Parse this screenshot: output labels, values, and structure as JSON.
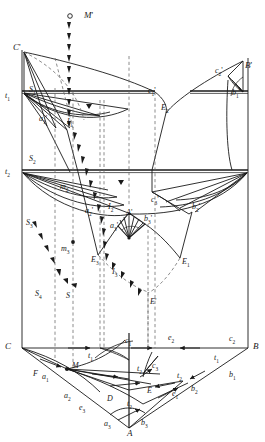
{
  "figure": {
    "type": "descriptive-geometry-projection-diagram",
    "title": "",
    "stroke_color": "#1a1a1a",
    "dashed_color": "#555555",
    "background": "#ffffff"
  },
  "labels": [
    {
      "id": "M-prime",
      "text": "M",
      "prime": "'",
      "x": 84,
      "y": 11,
      "size": "big"
    },
    {
      "id": "C-prime",
      "text": "C",
      "prime": "'",
      "x": 13,
      "y": 43,
      "size": "big"
    },
    {
      "id": "B-prime",
      "text": "B",
      "prime": "'",
      "x": 245,
      "y": 61,
      "size": "big"
    },
    {
      "id": "t1-upper",
      "text": "t",
      "sub": "1",
      "x": 5,
      "y": 92
    },
    {
      "id": "S1",
      "text": "S",
      "sub": "1",
      "x": 29,
      "y": 86
    },
    {
      "id": "c1-prime",
      "text": "c",
      "sub": "1",
      "prime": "'",
      "x": 148,
      "y": 87
    },
    {
      "id": "c2-prime-upper",
      "text": "c",
      "sub": "2",
      "prime": "'",
      "x": 215,
      "y": 67
    },
    {
      "id": "b1-prime",
      "text": "b",
      "sub": "1",
      "prime": "'",
      "x": 232,
      "y": 89
    },
    {
      "id": "a1-prime",
      "text": "a",
      "sub": "1",
      "prime": "'",
      "x": 39,
      "y": 115
    },
    {
      "id": "I1",
      "text": "I",
      "sub": "1",
      "x": 67,
      "y": 118
    },
    {
      "id": "E2",
      "text": "E",
      "sub": "2",
      "x": 161,
      "y": 104
    },
    {
      "id": "t2-left",
      "text": "t",
      "sub": "2",
      "x": 5,
      "y": 168
    },
    {
      "id": "S2",
      "text": "S",
      "sub": "2",
      "x": 29,
      "y": 155
    },
    {
      "id": "m2",
      "text": "m",
      "sub": "2",
      "x": 60,
      "y": 183
    },
    {
      "id": "c3-prime",
      "text": "c",
      "sub": "3",
      "prime": "'",
      "x": 151,
      "y": 196
    },
    {
      "id": "b2-prime",
      "text": "b",
      "sub": "2",
      "prime": "'",
      "x": 192,
      "y": 203
    },
    {
      "id": "a2-prime",
      "text": "a",
      "sub": "2",
      "prime": "'",
      "x": 85,
      "y": 207
    },
    {
      "id": "I2",
      "text": "I",
      "sub": "2",
      "x": 108,
      "y": 203
    },
    {
      "id": "A-prime",
      "text": "A",
      "prime": "'",
      "x": 126,
      "y": 209
    },
    {
      "id": "b3-prime",
      "text": "b",
      "sub": "3",
      "prime": "'",
      "x": 144,
      "y": 215
    },
    {
      "id": "a3-prime",
      "text": "a",
      "sub": "3",
      "prime": "'",
      "x": 110,
      "y": 222
    },
    {
      "id": "S3",
      "text": "S",
      "sub": "3",
      "x": 26,
      "y": 219
    },
    {
      "id": "m3",
      "text": "m",
      "sub": "3",
      "x": 61,
      "y": 245
    },
    {
      "id": "E3",
      "text": "E",
      "sub": "3",
      "x": 91,
      "y": 256
    },
    {
      "id": "E1",
      "text": "E",
      "sub": "1",
      "x": 182,
      "y": 258
    },
    {
      "id": "I3",
      "text": "I",
      "sub": "3",
      "x": 112,
      "y": 268
    },
    {
      "id": "S4",
      "text": "S",
      "sub": "4",
      "x": 35,
      "y": 290
    },
    {
      "id": "S-plain",
      "text": "S",
      "x": 66,
      "y": 292
    },
    {
      "id": "E-prime",
      "text": "E",
      "prime": "'",
      "x": 150,
      "y": 298
    },
    {
      "id": "C-base",
      "text": "C",
      "x": 5,
      "y": 342,
      "size": "big"
    },
    {
      "id": "B-base",
      "text": "B",
      "x": 253,
      "y": 342,
      "size": "big"
    },
    {
      "id": "c1-base",
      "text": "c",
      "sub": "1",
      "x": 125,
      "y": 337
    },
    {
      "id": "e2-base",
      "text": "e",
      "sub": "2",
      "x": 168,
      "y": 334
    },
    {
      "id": "c2-base",
      "text": "c",
      "sub": "2",
      "x": 229,
      "y": 335
    },
    {
      "id": "t1-mid-left",
      "text": "t",
      "sub": "1",
      "x": 88,
      "y": 352
    },
    {
      "id": "t1-mid-right",
      "text": "t",
      "sub": "1",
      "x": 214,
      "y": 354
    },
    {
      "id": "F",
      "text": "F",
      "x": 33,
      "y": 370
    },
    {
      "id": "a1-base",
      "text": "a",
      "sub": "1",
      "x": 42,
      "y": 373
    },
    {
      "id": "M-base",
      "text": "M",
      "x": 72,
      "y": 362
    },
    {
      "id": "t2-upper-right",
      "text": "t",
      "sub": "2",
      "x": 137,
      "y": 365
    },
    {
      "id": "c3-base",
      "text": "c",
      "sub": "3",
      "x": 152,
      "y": 362
    },
    {
      "id": "t2-right",
      "text": "t",
      "sub": "2",
      "x": 177,
      "y": 372
    },
    {
      "id": "b1-base",
      "text": "b",
      "sub": "1",
      "x": 229,
      "y": 371
    },
    {
      "id": "a2-base",
      "text": "a",
      "sub": "2",
      "x": 64,
      "y": 392
    },
    {
      "id": "D",
      "text": "D",
      "x": 107,
      "y": 395
    },
    {
      "id": "E-base",
      "text": "E",
      "x": 147,
      "y": 387
    },
    {
      "id": "e1-base",
      "text": "e",
      "sub": "1",
      "x": 172,
      "y": 390
    },
    {
      "id": "b2-base",
      "text": "b",
      "sub": "2",
      "x": 191,
      "y": 385
    },
    {
      "id": "e3-base",
      "text": "e",
      "sub": "3",
      "x": 79,
      "y": 404
    },
    {
      "id": "t2-lower",
      "text": "t",
      "sub": "2",
      "x": 127,
      "y": 400
    },
    {
      "id": "a3-base",
      "text": "a",
      "sub": "3",
      "x": 104,
      "y": 420
    },
    {
      "id": "b3-base",
      "text": "b",
      "sub": "3",
      "x": 141,
      "y": 419
    },
    {
      "id": "A-base",
      "text": "A",
      "x": 127,
      "y": 429,
      "size": "big"
    }
  ],
  "geometry": {
    "frame": {
      "left_x": 22,
      "right_x": 248,
      "top_y": 50,
      "base_y": 348,
      "apex_A": [
        129,
        428
      ]
    },
    "horizon_lines": [
      {
        "name": "t1-line",
        "y": 92
      },
      {
        "name": "t2-line",
        "y": 171
      },
      {
        "name": "base-line",
        "y": 348
      }
    ],
    "markers": [
      {
        "name": "M-prime-point",
        "x": 70,
        "y": 16,
        "r": 2.2
      },
      {
        "name": "m3-point",
        "x": 73,
        "y": 242,
        "r": 1.8
      },
      {
        "name": "M-base-point",
        "x": 67,
        "y": 369,
        "r": 2.0
      }
    ]
  }
}
